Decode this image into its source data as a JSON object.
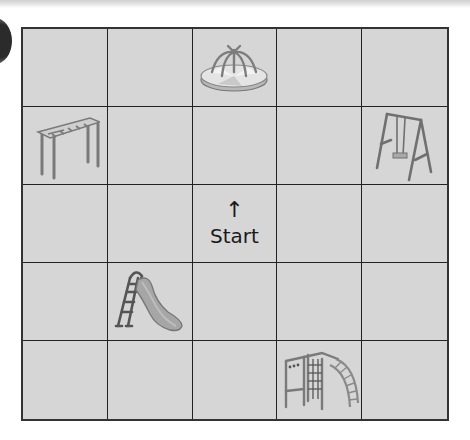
{
  "grid": {
    "rows": 5,
    "cols": 5,
    "cells": [
      [
        "",
        "",
        "roundabout",
        "",
        ""
      ],
      [
        "monkey-bars",
        "",
        "",
        "",
        "swing"
      ],
      [
        "",
        "",
        "start",
        "",
        ""
      ],
      [
        "",
        "slide",
        "",
        "",
        ""
      ],
      [
        "",
        "",
        "",
        "climbing-frame",
        ""
      ]
    ]
  },
  "start": {
    "arrow": "↑",
    "label": "Start"
  },
  "colors": {
    "cell_bg": "#d6d6d6",
    "grid_line": "#222222",
    "equipment": "#8a8a8a"
  }
}
